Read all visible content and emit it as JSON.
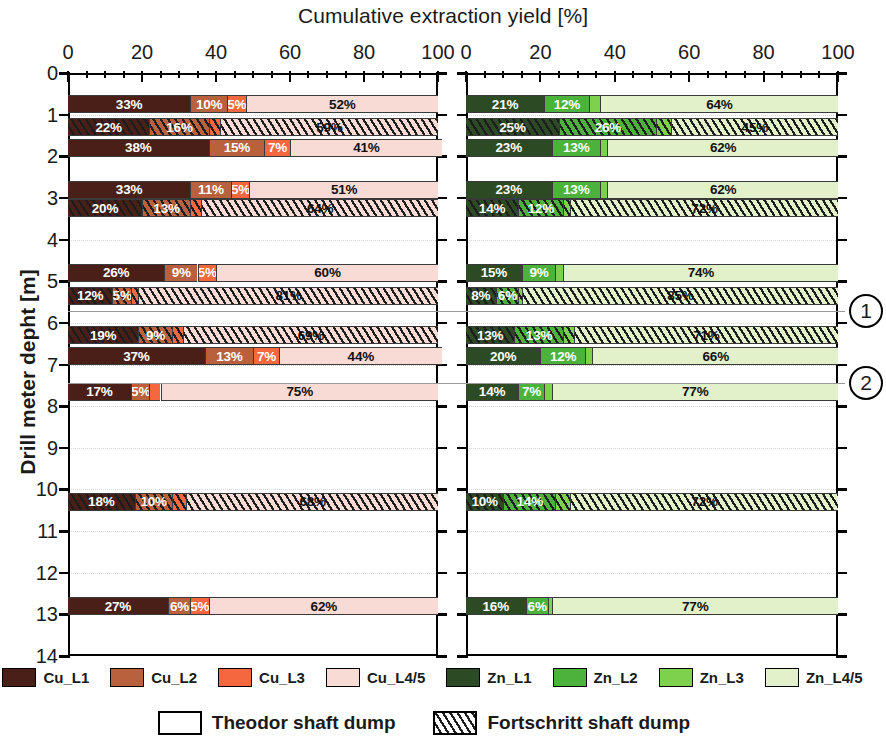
{
  "chart_data": {
    "type": "bar",
    "orientation": "horizontal",
    "stacked": true,
    "title": "Cumulative extraction yield [%]",
    "xlabel": "Cumulative extraction yield [%]",
    "ylabel": "Drill meter depht [m]",
    "xlim": [
      0,
      100
    ],
    "ylim": [
      0,
      14
    ],
    "y_inverted": true,
    "grid": "dotted-horizontal",
    "x_ticks_major": [
      0,
      20,
      40,
      60,
      80,
      100
    ],
    "x_tick_labels": [
      "0",
      "20",
      "40",
      "60",
      "80",
      "100"
    ],
    "x_ticks_minor_step": 5,
    "y_ticks": [
      0,
      1,
      2,
      3,
      4,
      5,
      6,
      7,
      8,
      9,
      10,
      11,
      12,
      13,
      14
    ],
    "y_tick_labels": [
      "0",
      "1",
      "2",
      "3",
      "4",
      "5",
      "6",
      "7",
      "8",
      "9",
      "10",
      "11",
      "12",
      "13",
      "14"
    ],
    "panels": [
      {
        "id": "cu",
        "metal": "Cu",
        "series": [
          {
            "name": "Cu_L1",
            "color": "#4a1f17"
          },
          {
            "name": "Cu_L2",
            "color": "#b9603c"
          },
          {
            "name": "Cu_L3",
            "color": "#f4673f"
          },
          {
            "name": "Cu_L4/5",
            "color": "#f9dbd6"
          }
        ],
        "bars": [
          {
            "depth": 0.75,
            "dump": "Theodor",
            "values": [
              33,
              10,
              5,
              52
            ],
            "labels": [
              "33%",
              "10%",
              "5%",
              "52%"
            ]
          },
          {
            "depth": 1.3,
            "dump": "Fortschritt",
            "values": [
              22,
              16,
              3,
              59
            ],
            "labels": [
              "22%",
              "16%",
              "",
              "59%"
            ]
          },
          {
            "depth": 1.8,
            "dump": "Theodor",
            "values": [
              38,
              15,
              7,
              41
            ],
            "labels": [
              "38%",
              "15%",
              "7%",
              "41%"
            ]
          },
          {
            "depth": 2.8,
            "dump": "Theodor",
            "values": [
              33,
              11,
              5,
              51
            ],
            "labels": [
              "33%",
              "11%",
              "5%",
              "51%"
            ]
          },
          {
            "depth": 3.25,
            "dump": "Fortschritt",
            "values": [
              20,
              13,
              3,
              64
            ],
            "labels": [
              "20%",
              "13%",
              "",
              "64%"
            ]
          },
          {
            "depth": 4.8,
            "dump": "Theodor",
            "values": [
              26,
              9,
              5,
              60
            ],
            "labels": [
              "26%",
              "9%",
              "5%",
              "60%"
            ]
          },
          {
            "depth": 5.35,
            "dump": "Fortschritt",
            "values": [
              12,
              5,
              2,
              81
            ],
            "labels": [
              "12%",
              "5%",
              "",
              "81%"
            ]
          },
          {
            "depth": 6.3,
            "dump": "Fortschritt",
            "values": [
              19,
              9,
              3,
              69
            ],
            "labels": [
              "19%",
              "9%",
              "",
              "69%"
            ]
          },
          {
            "depth": 6.8,
            "dump": "Theodor",
            "values": [
              37,
              13,
              7,
              44
            ],
            "labels": [
              "37%",
              "13%",
              "7%",
              "44%"
            ]
          },
          {
            "depth": 7.65,
            "dump": "Theodor",
            "values": [
              17,
              5,
              3,
              75
            ],
            "labels": [
              "17%",
              "5%",
              "",
              "75%"
            ]
          },
          {
            "depth": 10.3,
            "dump": "Fortschritt",
            "values": [
              18,
              10,
              4,
              68
            ],
            "labels": [
              "18%",
              "10%",
              "",
              "68%"
            ]
          },
          {
            "depth": 12.8,
            "dump": "Theodor",
            "values": [
              27,
              6,
              5,
              62
            ],
            "labels": [
              "27%",
              "6%",
              "5%",
              "62%"
            ]
          }
        ]
      },
      {
        "id": "zn",
        "metal": "Zn",
        "series": [
          {
            "name": "Zn_L1",
            "color": "#2c4a24"
          },
          {
            "name": "Zn_L2",
            "color": "#4cb23c"
          },
          {
            "name": "Zn_L3",
            "color": "#7dd14d"
          },
          {
            "name": "Zn_L4/5",
            "color": "#e2f1ca"
          }
        ],
        "bars": [
          {
            "depth": 0.75,
            "dump": "Theodor",
            "values": [
              21,
              12,
              3,
              64
            ],
            "labels": [
              "21%",
              "12%",
              "",
              "64%"
            ]
          },
          {
            "depth": 1.3,
            "dump": "Fortschritt",
            "values": [
              25,
              26,
              4,
              45
            ],
            "labels": [
              "25%",
              "26%",
              "",
              "45%"
            ]
          },
          {
            "depth": 1.8,
            "dump": "Theodor",
            "values": [
              23,
              13,
              2,
              62
            ],
            "labels": [
              "23%",
              "13%",
              "",
              "62%"
            ]
          },
          {
            "depth": 2.8,
            "dump": "Theodor",
            "values": [
              23,
              13,
              2,
              62
            ],
            "labels": [
              "23%",
              "13%",
              "",
              "62%"
            ]
          },
          {
            "depth": 3.25,
            "dump": "Fortschritt",
            "values": [
              14,
              12,
              2,
              72
            ],
            "labels": [
              "14%",
              "12%",
              "",
              "72%"
            ]
          },
          {
            "depth": 4.8,
            "dump": "Theodor",
            "values": [
              15,
              9,
              2,
              74
            ],
            "labels": [
              "15%",
              "9%",
              "",
              "74%"
            ]
          },
          {
            "depth": 5.35,
            "dump": "Fortschritt",
            "values": [
              8,
              6,
              1,
              85
            ],
            "labels": [
              "8%",
              "6%",
              "",
              "85%"
            ]
          },
          {
            "depth": 6.3,
            "dump": "Fortschritt",
            "values": [
              13,
              13,
              3,
              71
            ],
            "labels": [
              "13%",
              "13%",
              "",
              "71%"
            ]
          },
          {
            "depth": 6.8,
            "dump": "Theodor",
            "values": [
              20,
              12,
              2,
              66
            ],
            "labels": [
              "20%",
              "12%",
              "",
              "66%"
            ]
          },
          {
            "depth": 7.65,
            "dump": "Theodor",
            "values": [
              14,
              7,
              2,
              77
            ],
            "labels": [
              "14%",
              "7%",
              "",
              "77%"
            ]
          },
          {
            "depth": 10.3,
            "dump": "Fortschritt",
            "values": [
              10,
              14,
              4,
              72
            ],
            "labels": [
              "10%",
              "14%",
              "",
              "72%"
            ]
          },
          {
            "depth": 12.8,
            "dump": "Theodor",
            "values": [
              16,
              6,
              1,
              77
            ],
            "labels": [
              "16%",
              "6%",
              "",
              "77%"
            ]
          }
        ]
      }
    ],
    "annotations": [
      {
        "label": "1",
        "depth": 5.72
      },
      {
        "label": "2",
        "depth": 7.45
      }
    ],
    "legend_series": [
      {
        "label": "Cu_L1",
        "color": "#4a1f17"
      },
      {
        "label": "Cu_L2",
        "color": "#b9603c"
      },
      {
        "label": "Cu_L3",
        "color": "#f4673f"
      },
      {
        "label": "Cu_L4/5",
        "color": "#f9dbd6"
      },
      {
        "label": "Zn_L1",
        "color": "#2c4a24"
      },
      {
        "label": "Zn_L2",
        "color": "#4cb23c"
      },
      {
        "label": "Zn_L3",
        "color": "#7dd14d"
      },
      {
        "label": "Zn_L4/5",
        "color": "#e2f1ca"
      }
    ],
    "legend_dumps": [
      {
        "label": "Theodor shaft dump",
        "pattern": "solid"
      },
      {
        "label": "Fortschritt shaft dump",
        "pattern": "hatched"
      }
    ]
  }
}
